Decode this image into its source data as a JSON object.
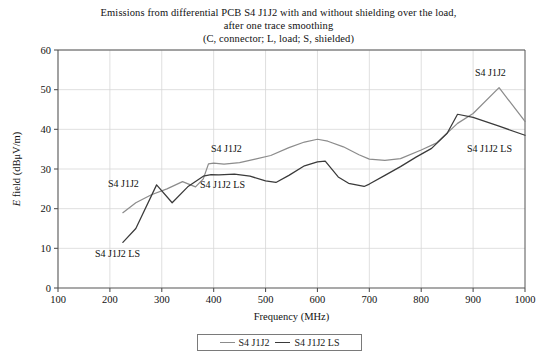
{
  "title": {
    "line1": "Emissions from differential PCB S4 J1J2 with and without shielding over the load,",
    "line2": "after one trace smoothing",
    "line3": "(C, connector; L, load; S, shielded)"
  },
  "legend": {
    "items": [
      {
        "label": "S4 J1J2",
        "color": "#8c8c8c"
      },
      {
        "label": "S4 J1J2 LS",
        "color": "#3a3a3a"
      }
    ]
  },
  "annotations": [
    {
      "id": "annot-s4-j1j2-left",
      "text": "S4 J1J2",
      "x": 108,
      "y": 187
    },
    {
      "id": "annot-s4-j1j2-ls-left",
      "text": "S4 J1J2 LS",
      "x": 95,
      "y": 257
    },
    {
      "id": "annot-s4-j1j2-mid",
      "text": "S4 J1J2",
      "x": 211,
      "y": 152
    },
    {
      "id": "annot-s4-j1j2-ls-mid",
      "text": "S4 J1J2 LS",
      "x": 200,
      "y": 188
    },
    {
      "id": "annot-s4-j1j2-right",
      "text": "S4 J1J2",
      "x": 475,
      "y": 76
    },
    {
      "id": "annot-s4-j1j2-ls-right",
      "text": "S4 J1J2 LS",
      "x": 467,
      "y": 152
    }
  ],
  "chart_data": {
    "type": "line",
    "title": "Emissions from differential PCB S4 J1J2 with and without shielding over the load, after one trace smoothing (C, connector; L, load; S, shielded)",
    "xlabel": "Frequency (MHz)",
    "ylabel": "E field (dBμV/m)",
    "xlim": [
      100,
      1000
    ],
    "ylim": [
      0,
      60
    ],
    "xticks": [
      100,
      200,
      300,
      400,
      500,
      600,
      700,
      800,
      900,
      1000
    ],
    "yticks": [
      0,
      10,
      20,
      30,
      40,
      50,
      60
    ],
    "grid": true,
    "legend_position": "bottom-center",
    "series": [
      {
        "name": "S4 J1J2",
        "color": "#8c8c8c",
        "x": [
          225,
          250,
          280,
          310,
          340,
          365,
          380,
          390,
          400,
          420,
          450,
          480,
          510,
          545,
          575,
          600,
          620,
          650,
          680,
          700,
          730,
          760,
          800,
          830,
          870,
          900,
          950,
          1000
        ],
        "y": [
          19.0,
          21.5,
          23.5,
          25.0,
          26.8,
          25.5,
          27.5,
          31.3,
          31.5,
          31.2,
          31.6,
          32.5,
          33.4,
          35.4,
          36.8,
          37.5,
          37.0,
          35.6,
          33.6,
          32.5,
          32.2,
          32.6,
          34.8,
          36.6,
          41.5,
          44.0,
          50.5,
          42.0
        ]
      },
      {
        "name": "S4 J1J2 LS",
        "color": "#3a3a3a",
        "x": [
          225,
          250,
          290,
          320,
          350,
          380,
          395,
          410,
          440,
          470,
          500,
          520,
          545,
          575,
          600,
          615,
          640,
          660,
          690,
          700,
          730,
          760,
          790,
          820,
          850,
          870,
          900,
          950,
          1000
        ],
        "y": [
          11.5,
          15.0,
          26.0,
          21.5,
          25.5,
          28.2,
          28.6,
          28.5,
          28.7,
          28.2,
          27.0,
          26.6,
          28.4,
          30.8,
          31.8,
          32.0,
          28.0,
          26.4,
          25.6,
          26.2,
          28.4,
          30.6,
          33.0,
          35.2,
          39.0,
          43.8,
          43.0,
          40.8,
          38.5
        ]
      }
    ]
  }
}
